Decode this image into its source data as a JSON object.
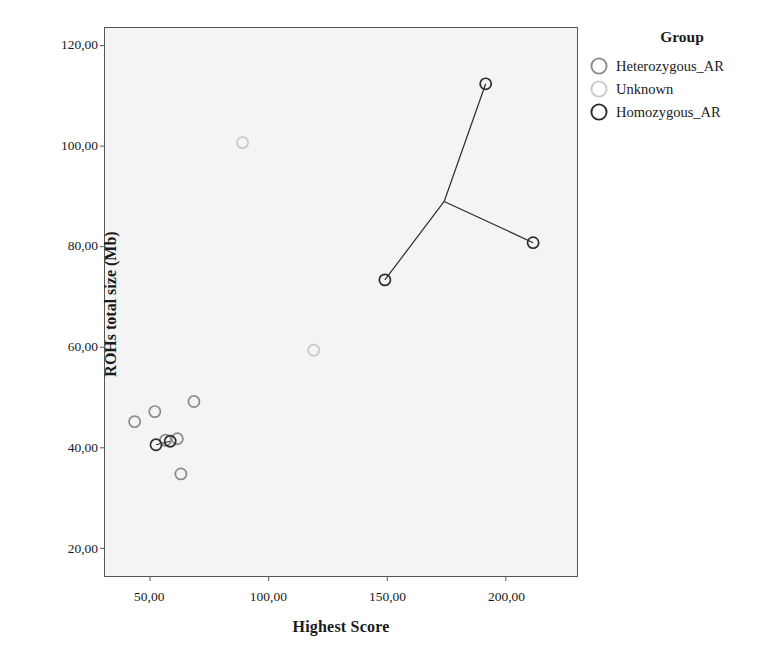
{
  "chart_data": {
    "type": "scatter",
    "title": "",
    "xlabel": "Highest Score",
    "ylabel": "ROHs total size (Mb)",
    "xlim": [
      31,
      230
    ],
    "ylim": [
      14.5,
      123.5
    ],
    "grid": false,
    "legend": {
      "title": "Group",
      "position": "right",
      "entries": [
        {
          "name": "Heterozygous_AR",
          "color": "#8a8a8a",
          "marker": "open-circle"
        },
        {
          "name": "Unknown",
          "color": "#c9c9c9",
          "marker": "open-circle"
        },
        {
          "name": "Homozygous_AR",
          "color": "#2b2b2b",
          "marker": "open-circle"
        }
      ]
    },
    "xticks": [
      50,
      100,
      150,
      200
    ],
    "xtick_labels": [
      "50,00",
      "100,00",
      "150,00",
      "200,00"
    ],
    "yticks": [
      20,
      40,
      60,
      80,
      100,
      120
    ],
    "ytick_labels": [
      "20,00",
      "40,00",
      "60,00",
      "80,00",
      "100,00",
      "120,00"
    ],
    "series": [
      {
        "name": "Heterozygous_AR",
        "color": "#8a8a8a",
        "points": [
          {
            "x": 43.5,
            "y": 45.2
          },
          {
            "x": 52.0,
            "y": 47.2
          },
          {
            "x": 56.5,
            "y": 41.5
          },
          {
            "x": 61.5,
            "y": 41.8
          },
          {
            "x": 68.5,
            "y": 49.2
          },
          {
            "x": 63.0,
            "y": 34.8
          }
        ]
      },
      {
        "name": "Unknown",
        "color": "#c9c9c9",
        "points": [
          {
            "x": 89.0,
            "y": 100.7
          },
          {
            "x": 119.0,
            "y": 59.4
          }
        ]
      },
      {
        "name": "Homozygous_AR",
        "color": "#2b2b2b",
        "points": [
          {
            "x": 52.5,
            "y": 40.6
          },
          {
            "x": 58.5,
            "y": 41.3
          },
          {
            "x": 149.0,
            "y": 73.4
          },
          {
            "x": 191.5,
            "y": 112.4
          },
          {
            "x": 211.5,
            "y": 80.8
          }
        ]
      }
    ],
    "connector_lines": [
      {
        "from": {
          "x": 52.5,
          "y": 40.6
        },
        "to": {
          "x": 58.5,
          "y": 41.3
        },
        "color": "#2b2b2b"
      },
      {
        "from": {
          "x": 191.5,
          "y": 112.4
        },
        "to": {
          "x": 174.0,
          "y": 89.0
        },
        "color": "#2b2b2b"
      },
      {
        "from": {
          "x": 174.0,
          "y": 89.0
        },
        "to": {
          "x": 149.0,
          "y": 73.4
        },
        "color": "#2b2b2b"
      },
      {
        "from": {
          "x": 174.0,
          "y": 89.0
        },
        "to": {
          "x": 211.5,
          "y": 80.8
        },
        "color": "#2b2b2b"
      }
    ]
  }
}
